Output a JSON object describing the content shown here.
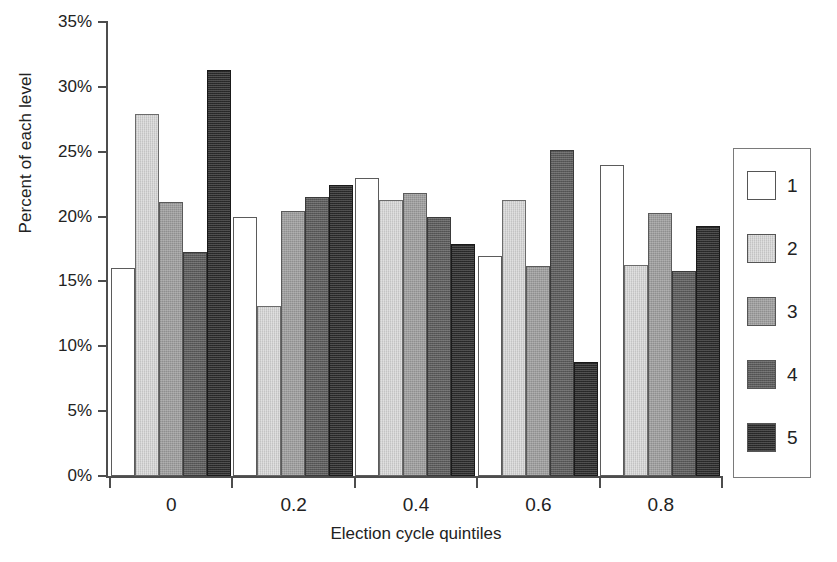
{
  "chart_data": {
    "type": "bar",
    "title": "",
    "xlabel": "Election cycle quintiles",
    "ylabel": "Percent of each level",
    "categories": [
      "0",
      "0.2",
      "0.4",
      "0.6",
      "0.8"
    ],
    "ylim": [
      0,
      35
    ],
    "yticks": [
      0,
      5,
      10,
      15,
      20,
      25,
      30,
      35
    ],
    "ytick_labels": [
      "0%",
      "5%",
      "10%",
      "15%",
      "20%",
      "25%",
      "30%",
      "35%"
    ],
    "grid": false,
    "legend_position": "right",
    "series": [
      {
        "name": "1",
        "color": "#ffffff",
        "values": [
          16.0,
          20.0,
          23.0,
          17.0,
          24.0
        ]
      },
      {
        "name": "2",
        "color": "#d9d9d9",
        "values": [
          27.9,
          13.1,
          21.3,
          21.3,
          16.3
        ]
      },
      {
        "name": "3",
        "color": "#9f9f9f",
        "values": [
          21.1,
          20.4,
          21.8,
          16.2,
          20.3
        ]
      },
      {
        "name": "4",
        "color": "#5b5b5b",
        "values": [
          17.3,
          21.5,
          20.0,
          25.1,
          15.8
        ]
      },
      {
        "name": "5",
        "color": "#2b2b2b",
        "values": [
          31.3,
          22.4,
          17.9,
          8.8,
          19.3
        ]
      }
    ]
  },
  "legend": {
    "items": [
      {
        "label": "1"
      },
      {
        "label": "2"
      },
      {
        "label": "3"
      },
      {
        "label": "4"
      },
      {
        "label": "5"
      }
    ]
  }
}
